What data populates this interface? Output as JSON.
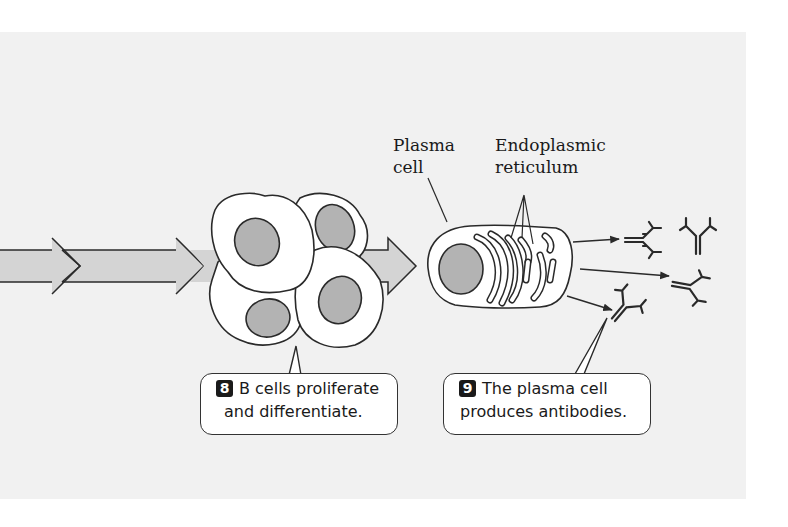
{
  "labels": {
    "plasma_cell": [
      "Plasma",
      "cell"
    ],
    "endoplasmic_reticulum": [
      "Endoplasmic",
      "reticulum"
    ]
  },
  "callouts": [
    {
      "step": "8",
      "line1": "B cells proliferate",
      "line2": "and differentiate."
    },
    {
      "step": "9",
      "line1": "The plasma cell",
      "line2": "produces antibodies."
    }
  ],
  "colors": {
    "panel_background": "#f1f1f1",
    "arrow_fill": "#d4d4d4",
    "nucleus_fill": "#b3b3b3",
    "outline": "#2a2a2a"
  },
  "elements": {
    "flow_arrows": 3,
    "b_cells": 4,
    "plasma_cells": 1,
    "antibodies": 4
  }
}
